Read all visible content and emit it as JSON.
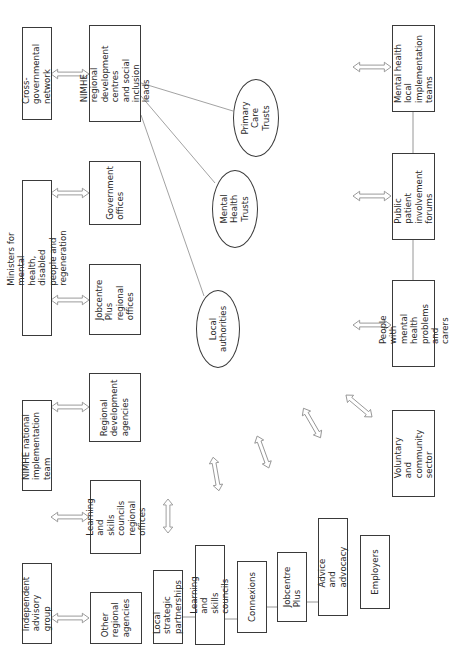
{
  "diagram": {
    "orientation": "rotated -90deg (landscape figure on portrait page)",
    "line_color": "#3a3a3a",
    "connector_color": "#8a8a8a",
    "boxes": [
      {
        "id": "cross-governmental-network",
        "label": "Cross-governmental\nnetwork"
      },
      {
        "id": "nimhe-regional",
        "label": "NIMHE regional\ndevelopment centres\nand social inclusion\nleads"
      },
      {
        "id": "ministers",
        "label": "Ministers for mental health, disabled\npeople and regeneration"
      },
      {
        "id": "government-offices",
        "label": "Government\noffices"
      },
      {
        "id": "jobcentre-plus-regional",
        "label": "Jobcentre Plus\nregional offices"
      },
      {
        "id": "nimhe-national",
        "label": "NIMHE national\nimplementation team"
      },
      {
        "id": "regional-development-agencies",
        "label": "Regional\ndevelopment\nagencies"
      },
      {
        "id": "lsc-regional",
        "label": "Learning and\nskills councils\nregional offices"
      },
      {
        "id": "independent-advisory-group",
        "label": "Independent\nadvisory group"
      },
      {
        "id": "other-regional-agencies",
        "label": "Other\nregional\nagencies"
      },
      {
        "id": "local-strategic-partnerships",
        "label": "Local strategic\npartnerships"
      },
      {
        "id": "learning-skills-councils",
        "label": "Learning and skills\ncouncils"
      },
      {
        "id": "connexions",
        "label": "Connexions"
      },
      {
        "id": "jobcentre-plus",
        "label": "Jobcentre Plus"
      },
      {
        "id": "advice-advocacy",
        "label": "Advice and advocacy"
      },
      {
        "id": "employers",
        "label": "Employers"
      },
      {
        "id": "voluntary-community",
        "label": "Voluntary and\ncommunity\nsector"
      },
      {
        "id": "people-mental-health",
        "label": "People with mental\nhealth problems\nand carers"
      },
      {
        "id": "public-patient-forums",
        "label": "Public patient\ninvolvement\nforums"
      },
      {
        "id": "mh-local-implementation",
        "label": "Mental health local\nimplementation\nteams"
      }
    ],
    "ellipses": [
      {
        "id": "primary-care-trusts",
        "label": "Primary Care\nTrusts"
      },
      {
        "id": "mental-health-trusts",
        "label": "Mental Health\nTrusts"
      },
      {
        "id": "local-authorities",
        "label": "Local\nauthorities"
      }
    ]
  }
}
